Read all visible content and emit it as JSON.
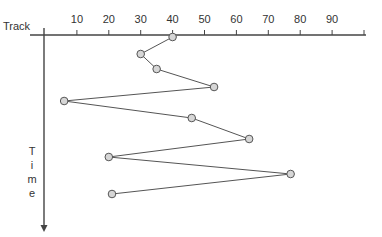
{
  "chart_data": {
    "type": "line",
    "title": "",
    "xlabel": "Track",
    "ylabel": "Time",
    "x_axis_position": "top",
    "y_axis_direction": "down",
    "xlim": [
      0,
      100
    ],
    "xticks": [
      10,
      20,
      30,
      40,
      50,
      60,
      70,
      80,
      90
    ],
    "grid": false,
    "legend": null,
    "series": [
      {
        "name": "head movement",
        "marker": "circle",
        "order": [
          1,
          2,
          3,
          4,
          5,
          6,
          7,
          8,
          9,
          10
        ],
        "x": [
          40,
          30,
          35,
          53,
          6,
          46,
          64,
          20,
          77,
          21
        ]
      }
    ]
  },
  "labels": {
    "track": "Track",
    "time_letters": [
      "T",
      "i",
      "m",
      "e"
    ]
  },
  "colors": {
    "axis": "#444444",
    "line": "#555555",
    "marker_fill": "#d6d6d6",
    "marker_stroke": "#555555",
    "text": "#333333"
  }
}
